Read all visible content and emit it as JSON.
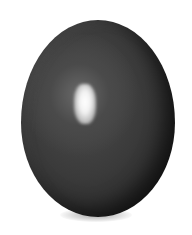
{
  "image": {
    "subject": "dark glossy egg-shaped stone",
    "background_color": "#ffffff",
    "object_color": "#333333",
    "highlight_color": "#ffffff"
  }
}
